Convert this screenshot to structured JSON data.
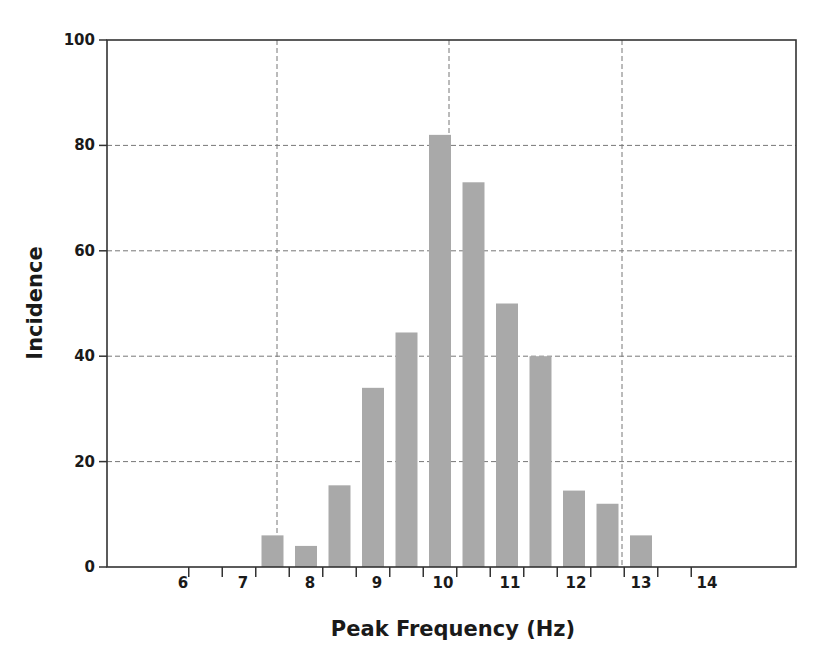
{
  "chart_data": {
    "type": "bar",
    "title": "",
    "xlabel": "Peak Frequency (Hz)",
    "ylabel": "Incidence",
    "ylim": [
      0,
      100
    ],
    "yticks": [
      0,
      20,
      40,
      60,
      80,
      100
    ],
    "xtick_labels": [
      "6",
      "7",
      "8",
      "9",
      "10",
      "11",
      "12",
      "13",
      "14"
    ],
    "grid": {
      "horizontal": [
        20,
        40,
        60,
        80
      ],
      "vertical_at_hz": [
        7.5,
        10,
        12.5
      ],
      "style": "dashed"
    },
    "bar_color": "#a9a9a9",
    "categories": [
      "7.5",
      "8",
      "8.5",
      "9",
      "9.5",
      "10",
      "10.5",
      "11",
      "11.5",
      "12",
      "12.5",
      "13"
    ],
    "values": [
      6,
      4,
      15.5,
      34,
      44.5,
      82,
      73,
      50,
      40,
      14.5,
      12,
      6
    ]
  }
}
